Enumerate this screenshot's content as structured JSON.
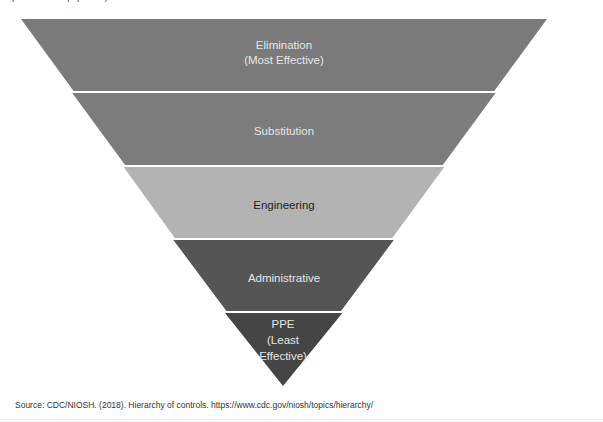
{
  "top_caption": "protective equipment).",
  "diagram": {
    "type": "inverted-pyramid",
    "title": "Hierarchy of Controls",
    "levels": [
      {
        "label_line1": "Elimination",
        "label_line2": "(Most Effective)",
        "label_line3": "",
        "fill": "#7a7a7a",
        "text_color": "#e6e6e6"
      },
      {
        "label_line1": "Substitution",
        "label_line2": "",
        "label_line3": "",
        "fill": "#7c7c7c",
        "text_color": "#e6e6e6"
      },
      {
        "label_line1": "Engineering",
        "label_line2": "",
        "label_line3": "",
        "fill": "#b3b3b3",
        "text_color": "#1e1e1e"
      },
      {
        "label_line1": "Administrative",
        "label_line2": "",
        "label_line3": "",
        "fill": "#555555",
        "text_color": "#e6e6e6"
      },
      {
        "label_line1": "PPE",
        "label_line2": "(Least",
        "label_line3": "Effective)",
        "fill": "#454545",
        "text_color": "#e6e6e6"
      }
    ]
  },
  "source": "Source: CDC/NIOSH. (2018). Hierarchy of controls. https://www.cdc.gov/niosh/topics/hierarchy/"
}
